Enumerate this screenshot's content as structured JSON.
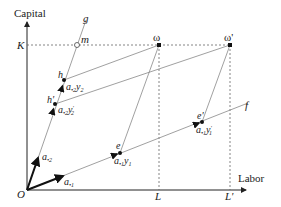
{
  "diagram": {
    "axes": {
      "y_label": "Capital",
      "x_label": "Labor",
      "origin_label": "O",
      "k_label": "K",
      "l_label": "L",
      "l_prime_label": "L'"
    },
    "lines": {
      "g_label": "g",
      "f_label": "f"
    },
    "points": {
      "m": "m",
      "omega": "ω",
      "omega_prime": "ω'",
      "h": "h",
      "h_prime": "h'",
      "e": "e",
      "e_prime": "e'"
    },
    "vectors": {
      "a2": "a",
      "a2_sub": "•2",
      "a1": "a",
      "a1_sub": "•1",
      "a2y2": "a",
      "a2y2_sub": "•2",
      "a2y2_y": "y",
      "a2y2_ysub": "2",
      "a2y2p": "a",
      "a2y2p_sub": "•2",
      "a2y2p_y": "y",
      "a2y2p_ysub": "2",
      "a1y1": "a",
      "a1y1_sub": "•1",
      "a1y1_y": "y",
      "a1y1_ysub": "1",
      "a1y1p": "a",
      "a1y1p_sub": "•1",
      "a1y1p_y": "y",
      "a1y1p_ysub": "1"
    },
    "colors": {
      "axis": "#222222",
      "line": "#888888",
      "dashed": "#666666",
      "point": "#111111"
    }
  }
}
